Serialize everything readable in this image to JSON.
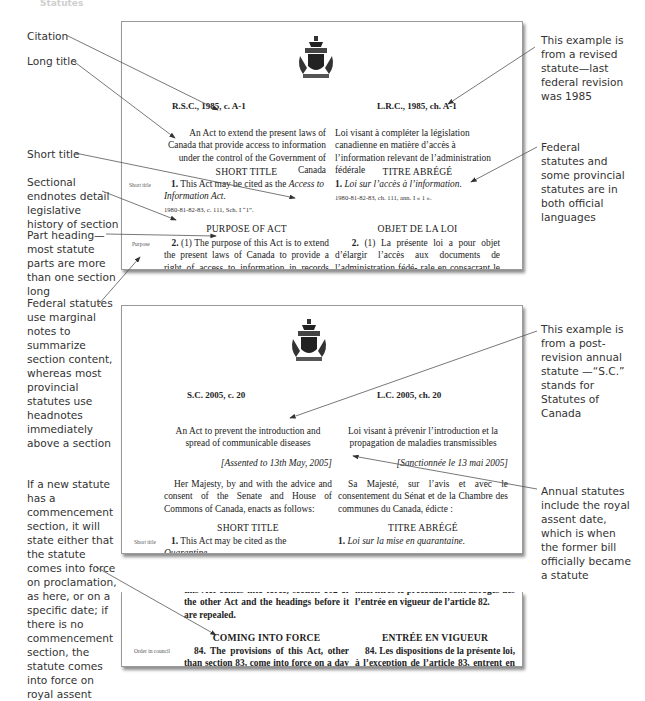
{
  "header": {
    "title": "Statutes"
  },
  "annotations_left": {
    "citation": "Citation",
    "long_title": "Long title",
    "short_title": "Short title",
    "sectional_endnotes": "Sectional endnotes detail legislative history of section",
    "part_heading": "Part heading—most statute parts are more than one section long",
    "marginal_notes": "Federal statutes use marginal notes to summarize section content, whereas most provincial statutes use headnotes immediately above a section",
    "commencement": "If a new statute has a commencement section, it will state either that the statute comes into force on proclamation, as here, or on a specific date; if there is no commencement section, the statute comes into force on royal assent"
  },
  "annotations_right": {
    "revised_statute": "This example is from a revised statute—last federal revision was 1985",
    "official_languages": "Federal statutes and some provincial statutes are in both official languages",
    "annual_statute": "This example is from a post-revision annual statute —“S.C.” stands for Statutes of Canada",
    "royal_assent": "Annual statutes include the royal assent date, which is when the former bill officially became a statute"
  },
  "page1": {
    "citation_en": "R.S.C., 1985, c. A-1",
    "citation_fr": "L.R.C., 1985, ch. A-1",
    "long_title_en": "An Act to extend the present laws of Canada that provide access to information under the control of the Government of Canada",
    "long_title_fr": "Loi visant à compléter la législation canadienne en matière d’accès à l’information relevant de l’administration fédérale",
    "heading_short_en": "SHORT TITLE",
    "heading_short_fr": "TITRE ABRÉGÉ",
    "margin_short_title": "Short title",
    "s1_en_prefix": "1.",
    "s1_en_text": "This Act may be cited as the",
    "s1_en_italic": "Access to Information Act.",
    "s1_fr_prefix": "1.",
    "s1_fr_italic": "Loi sur l’accès à l’information.",
    "endnote_en": "1980-81-82-83, c. 111, Sch. I “1”.",
    "endnote_fr": "1980-81-82-83, ch. 111, ann. I « 1 ».",
    "heading_purpose_en": "PURPOSE OF ACT",
    "heading_purpose_fr": "OBJET DE LA LOI",
    "margin_purpose": "Purpose",
    "s2_en_prefix": "2.",
    "s2_en_text": "(1) The purpose of this Act is to extend the present laws of Canada to provide a right of access to information in records under the con-",
    "s2_fr_prefix": "2.",
    "s2_fr_text": "(1) La présente loi a pour objet d’élargir l’accès aux documents de l’administration fédé- rale en consacrant le principe du droit du public"
  },
  "page2": {
    "citation_en": "S.C. 2005, c. 20",
    "citation_fr": "L.C. 2005, ch. 20",
    "long_title_en": "An Act to prevent the introduction and spread of communicable diseases",
    "long_title_fr": "Loi visant à prévenir l’introduction et la propagation de maladies transmissibles",
    "assent_en": "[Assented to 13th May, 2005]",
    "assent_fr": "[Sanctionnée le 13 mai 2005]",
    "enacting_en": "Her Majesty, by and with the advice and consent of the Senate and House of Commons of Canada, enacts as follows:",
    "enacting_fr": "Sa Majesté, sur l’avis et avec le consentement du Sénat et de la Chambre des communes du Canada, édicte :",
    "heading_short_en": "SHORT TITLE",
    "heading_short_fr": "TITRE ABRÉGÉ",
    "margin_short_title": "Short title",
    "s1_en_prefix": "1.",
    "s1_en_text": "This Act may be cited as the",
    "s1_en_italic": "Quarantine",
    "s1_fr_prefix": "1.",
    "s1_fr_italic": "Loi sur la mise en quarantaine."
  },
  "page3": {
    "prev_en_line0": "this Act comes into force, section 102 of the",
    "prev_en": "other Act and the headings before it are repealed.",
    "prev_fr_line0": "intertitres le précédant sont abrogés dès",
    "prev_fr": "l’entrée en vigueur de l’article 82.",
    "heading_en": "COMING INTO FORCE",
    "heading_fr": "ENTRÉE EN VIGUEUR",
    "margin_order": "Order in council",
    "s84_en": "84. The provisions of this Act, other than section 83, come into force on a day or days to be fixed by order of the Governor in",
    "s84_fr": "84. Les dispositions de la présente loi, à l’exception de l’article 83, entrent en vigueur à la date ou aux dates fixées par décret"
  },
  "colors": {
    "annotation_text": "#333333",
    "page_border": "#9a9a9a",
    "arrow": "#555555"
  }
}
